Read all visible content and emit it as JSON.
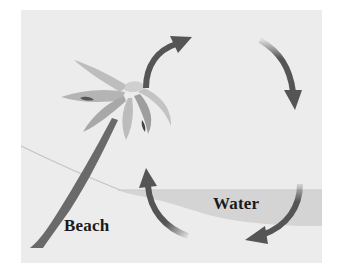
{
  "diagram": {
    "labels": {
      "beach": "Beach",
      "water": "Water"
    },
    "elements": [
      "palm-tree",
      "beach",
      "water",
      "circulation-arrows"
    ],
    "arrows": [
      {
        "name": "rising-arrow",
        "direction": "up-right"
      },
      {
        "name": "descending-arrow",
        "direction": "down"
      },
      {
        "name": "bottom-right-arrow",
        "direction": "down-left"
      },
      {
        "name": "left-rising-arrow",
        "direction": "up"
      }
    ],
    "colors": {
      "panel": "#ececec",
      "water": "#d6d6d6",
      "arrow": "#555555",
      "palm_leaf": "#b9b9b9",
      "palm_trunk": "#6a6a6a",
      "text": "#1a1a1a"
    }
  }
}
